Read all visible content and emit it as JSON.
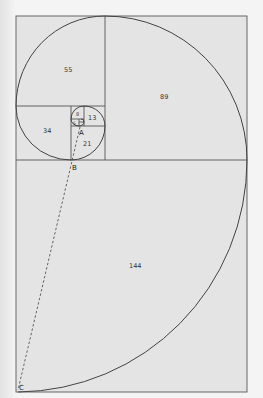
{
  "diagram": {
    "type": "fibonacci-golden-spiral",
    "colors": {
      "fill": "#e4e4e4",
      "stroke": "#555555",
      "background": "#f4f4f4"
    },
    "squares": [
      {
        "label": "144"
      },
      {
        "label": "89"
      },
      {
        "label": "55"
      },
      {
        "label": "34"
      },
      {
        "label": "21"
      },
      {
        "label": "13"
      },
      {
        "label": "8"
      },
      {
        "label": "5"
      }
    ],
    "points": [
      {
        "label": "A"
      },
      {
        "label": "B"
      },
      {
        "label": "C"
      }
    ]
  }
}
